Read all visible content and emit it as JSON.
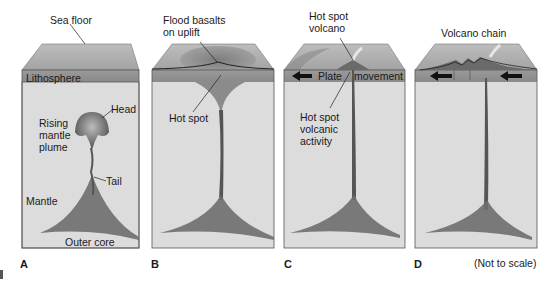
{
  "figure": {
    "panels": [
      {
        "id": "A",
        "letter": "A",
        "labels": {
          "sea_floor": "Sea floor",
          "lithosphere": "Lithosphere",
          "head": "Head",
          "rising_mantle_plume": "Rising mantle plume",
          "tail": "Tail",
          "mantle": "Mantle",
          "outer_core": "Outer core"
        }
      },
      {
        "id": "B",
        "letter": "B",
        "labels": {
          "flood_basalts": "Flood basalts on uplift",
          "hot_spot": "Hot spot"
        }
      },
      {
        "id": "C",
        "letter": "C",
        "labels": {
          "hot_spot_volcano": "Hot spot volcano",
          "plate": "Plate",
          "movement": "movement",
          "hot_spot_volcanic_activity": "Hot spot volcanic activity"
        }
      },
      {
        "id": "D",
        "letter": "D",
        "labels": {
          "volcano_chain": "Volcano chain"
        }
      }
    ],
    "scale_note": "(Not to scale)",
    "colors": {
      "sea_floor_top": "#a9a9a9",
      "lithosphere": "#8f8f8f",
      "mantle": "#dcdcdc",
      "outer_core": "#d0d0d0",
      "plume": "#6e6e6e",
      "border": "#555555",
      "text": "#1a1a1a"
    }
  }
}
